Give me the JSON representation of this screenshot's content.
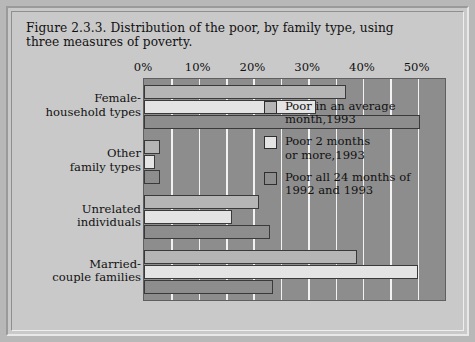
{
  "chart_data": {
    "type": "bar",
    "orientation": "horizontal",
    "title": "Figure 2.3.3. Distribution of the poor, by family type, using three measures of poverty.",
    "xlabel": "",
    "ylabel": "",
    "xlim": [
      0,
      55
    ],
    "xtick_labels": [
      "0%",
      "10%",
      "20%",
      "30%",
      "40%",
      "50%"
    ],
    "xtick_values": [
      0,
      10,
      20,
      30,
      40,
      50
    ],
    "gridline_values": [
      5,
      10,
      15,
      20,
      25,
      30,
      35,
      40,
      45,
      50
    ],
    "grid": true,
    "legend_position": "inside-right",
    "categories": [
      "Female-\nhousehold types",
      "Other\nfamily types",
      "Unrelated\nindividuals",
      "Married-\ncouple families"
    ],
    "series": [
      {
        "name": "Poor in an average\nmonth,1993",
        "color": "#b5b5b5",
        "values": [
          37.0,
          3.0,
          21.0,
          39.0
        ]
      },
      {
        "name": "Poor 2 months\nor more,1993",
        "color": "#e4e4e4",
        "values": [
          31.5,
          2.0,
          16.0,
          50.0
        ]
      },
      {
        "name": "Poor all 24 months of\n1992 and 1993",
        "color": "#8d8d8d",
        "values": [
          50.5,
          3.0,
          23.0,
          23.5
        ]
      }
    ]
  },
  "colors": {
    "page_background": "#b8b8b8",
    "panel_background": "#c9c9c9",
    "plot_background": "#8d8d8d",
    "gridline": "#f2f2f2",
    "bar_outline": "#3a3a3a",
    "text": "#111111"
  }
}
